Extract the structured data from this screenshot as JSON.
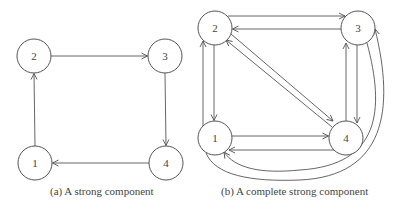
{
  "figures": [
    {
      "id": "a",
      "caption": "(a)  A strong component",
      "nodes": [
        {
          "id": "1",
          "label": "1",
          "x": 35,
          "y": 163
        },
        {
          "id": "2",
          "label": "2",
          "x": 34,
          "y": 56
        },
        {
          "id": "3",
          "label": "3",
          "x": 165,
          "y": 56
        },
        {
          "id": "4",
          "label": "4",
          "x": 166,
          "y": 163
        }
      ],
      "edges": [
        {
          "from": "1",
          "to": "2"
        },
        {
          "from": "2",
          "to": "3"
        },
        {
          "from": "3",
          "to": "4"
        },
        {
          "from": "4",
          "to": "1"
        }
      ]
    },
    {
      "id": "b",
      "caption": "(b)  A complete strong component",
      "nodes": [
        {
          "id": "1",
          "label": "1",
          "x": 215,
          "y": 138
        },
        {
          "id": "2",
          "label": "2",
          "x": 215,
          "y": 28
        },
        {
          "id": "3",
          "label": "3",
          "x": 358,
          "y": 28
        },
        {
          "id": "4",
          "label": "4",
          "x": 346,
          "y": 138
        }
      ],
      "edges": [
        {
          "from": "2",
          "to": "3"
        },
        {
          "from": "3",
          "to": "2"
        },
        {
          "from": "2",
          "to": "1"
        },
        {
          "from": "1",
          "to": "2"
        },
        {
          "from": "2",
          "to": "4"
        },
        {
          "from": "4",
          "to": "2"
        },
        {
          "from": "1",
          "to": "4"
        },
        {
          "from": "4",
          "to": "1"
        },
        {
          "from": "3",
          "to": "4"
        },
        {
          "from": "4",
          "to": "3"
        },
        {
          "from": "1",
          "to": "3"
        },
        {
          "from": "3",
          "to": "1"
        }
      ]
    }
  ],
  "style": {
    "node_radius": 17,
    "stroke_color": "#555555",
    "text_color": "#444444",
    "background": "#ffffff"
  }
}
